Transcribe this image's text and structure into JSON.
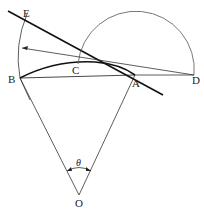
{
  "diagram": {
    "type": "geometry",
    "labels": {
      "E": "E",
      "B": "B",
      "C": "C",
      "A": "A",
      "D": "D",
      "O": "O",
      "theta": "θ"
    },
    "points": {
      "E": [
        20,
        20
      ],
      "B": [
        20,
        78
      ],
      "C": [
        78,
        64
      ],
      "A": [
        135,
        75
      ],
      "D": [
        194,
        75
      ],
      "O": [
        79,
        195
      ]
    },
    "colors": {
      "line": "#222222",
      "background": "#ffffff"
    }
  }
}
